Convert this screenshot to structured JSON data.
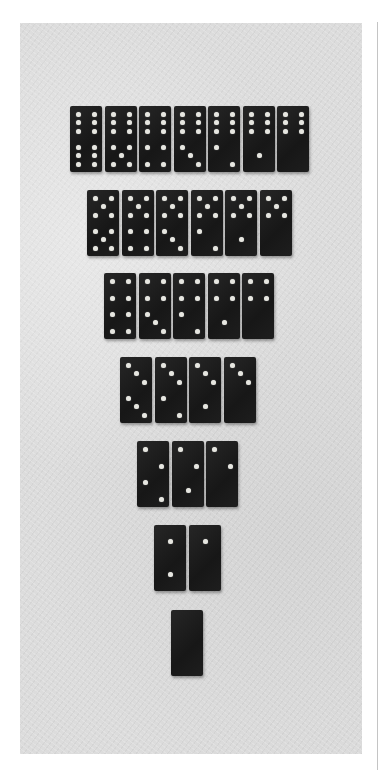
{
  "image": {
    "subject": "Double-six domino set arranged in an inverted triangle",
    "photo_bounds": {
      "x": 20,
      "y": 23,
      "w": 342,
      "h": 731
    },
    "colors": {
      "page_background": "#ffffff",
      "surface": "#dcdcdc",
      "domino_body": "#1c1c1c",
      "pip": "#e6e6e0",
      "rule": "#c4c4c4"
    }
  },
  "rows": [
    {
      "y": 106,
      "x_start": 70,
      "pitch": 34.5,
      "tiles": [
        [
          6,
          6
        ],
        [
          6,
          5
        ],
        [
          6,
          4
        ],
        [
          6,
          3
        ],
        [
          6,
          2
        ],
        [
          6,
          1
        ],
        [
          6,
          0
        ]
      ]
    },
    {
      "y": 190,
      "x_start": 87,
      "pitch": 34.5,
      "tiles": [
        [
          5,
          5
        ],
        [
          5,
          4
        ],
        [
          5,
          3
        ],
        [
          5,
          2
        ],
        [
          5,
          1
        ],
        [
          5,
          0
        ]
      ]
    },
    {
      "y": 273,
      "x_start": 104,
      "pitch": 34.5,
      "tiles": [
        [
          4,
          4
        ],
        [
          4,
          3
        ],
        [
          4,
          2
        ],
        [
          4,
          1
        ],
        [
          4,
          0
        ]
      ]
    },
    {
      "y": 357,
      "x_start": 120,
      "pitch": 34.5,
      "tiles": [
        [
          3,
          3
        ],
        [
          3,
          2
        ],
        [
          3,
          1
        ],
        [
          3,
          0
        ]
      ]
    },
    {
      "y": 441,
      "x_start": 137,
      "pitch": 34.5,
      "tiles": [
        [
          2,
          2
        ],
        [
          2,
          1
        ],
        [
          2,
          0
        ]
      ]
    },
    {
      "y": 525,
      "x_start": 154,
      "pitch": 34.5,
      "tiles": [
        [
          1,
          1
        ],
        [
          1,
          0
        ]
      ]
    },
    {
      "y": 610,
      "x_start": 171,
      "pitch": 34.5,
      "tiles": [
        [
          0,
          0
        ]
      ]
    }
  ]
}
